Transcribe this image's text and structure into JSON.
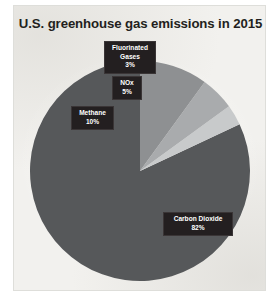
{
  "chart_data": {
    "type": "pie",
    "title": "U.S. greenhouse gas emissions in 2015",
    "xlabel": "",
    "ylabel": "",
    "legend": "none",
    "grid": false,
    "start_angle_deg": 90,
    "direction": "counterclockwise",
    "categories": [
      "Carbon Dioxide",
      "Fluorinated Gases",
      "NOx",
      "Methane"
    ],
    "values": [
      82,
      3,
      5,
      10
    ],
    "unit": "%",
    "slices": [
      {
        "label": "Carbon Dioxide",
        "value": 82,
        "value_text": "82%",
        "color": "#56585a"
      },
      {
        "label": "Fluorinated Gases",
        "value": 3,
        "value_text": "3%",
        "color": "#c8cacb"
      },
      {
        "label": "NOx",
        "value": 5,
        "value_text": "5%",
        "color": "#a9abad"
      },
      {
        "label": "Methane",
        "value": 10,
        "value_text": "10%",
        "color": "#8e9092"
      }
    ],
    "annotations": [
      {
        "label": "Fluorinated Gases",
        "line1": "Fluorinated",
        "line2": "Gases",
        "value_text": "3%"
      },
      {
        "label": "NOx",
        "line1": "NOx",
        "value_text": "5%"
      },
      {
        "label": "Methane",
        "line1": "Methane",
        "value_text": "10%"
      },
      {
        "label": "Carbon Dioxide",
        "line1": "Carbon Dioxide",
        "value_text": "82%"
      }
    ]
  },
  "colors": {
    "paper": "#f2f1ee",
    "paper_border": "#dededa",
    "title_text": "#231f20",
    "callout_background": "#231f20",
    "callout_text": "#ffffff",
    "carbon_dioxide": "#56585a",
    "methane": "#8e9092",
    "nox": "#a9abad",
    "fluorinated_gases": "#c8cacb"
  }
}
